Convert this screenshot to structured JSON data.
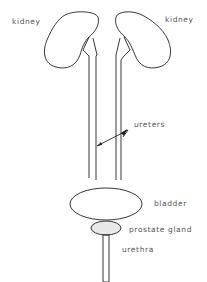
{
  "diagram": {
    "type": "anatomical-line-drawing",
    "labels": {
      "kidney_left": "kidney",
      "kidney_right": "kidney",
      "ureters": "ureters",
      "bladder": "bladder",
      "prostate": "prostate gland",
      "urethra": "urethra"
    },
    "colors": {
      "line": "#222222",
      "text": "#555555",
      "prostate_fill": "#e8e8e8",
      "background": "#ffffff"
    }
  }
}
